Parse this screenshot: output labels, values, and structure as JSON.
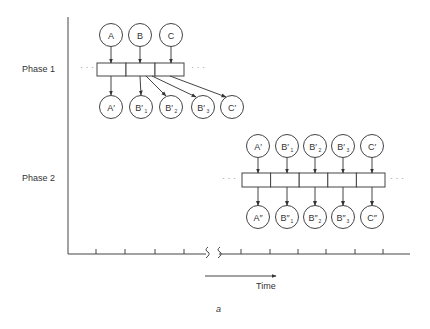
{
  "labels": {
    "phase1": "Phase 1",
    "phase2": "Phase 2",
    "time": "Time",
    "caption": "a",
    "ellipsis": "· · ·"
  },
  "colors": {
    "stroke": "#444444",
    "text": "#333333",
    "background": "#ffffff"
  },
  "axes": {
    "y_axis": {
      "x": 68,
      "y1": 17,
      "y2": 254
    },
    "x_axis": {
      "y": 254,
      "segments": [
        [
          68,
          206
        ],
        [
          219,
          410
        ]
      ]
    },
    "ticks_left": [
      96,
      125,
      155,
      184
    ],
    "ticks_right": [
      241,
      270,
      298,
      326,
      355,
      383
    ],
    "break_marks": [
      205,
      217
    ]
  },
  "phase1": {
    "inputs": [
      {
        "id": "A",
        "label": "A",
        "sub": "",
        "cx": 111,
        "cy": 35
      },
      {
        "id": "B",
        "label": "B",
        "sub": "",
        "cx": 140,
        "cy": 35
      },
      {
        "id": "C",
        "label": "C",
        "sub": "",
        "cx": 171,
        "cy": 35
      }
    ],
    "boxes": {
      "x": 97,
      "y": 63,
      "w": 29,
      "h": 13,
      "count": 3
    },
    "outputs": [
      {
        "id": "A1",
        "label": "A′",
        "sub": "",
        "cx": 111,
        "cy": 107
      },
      {
        "id": "B1",
        "label": "B′",
        "sub": "1",
        "cx": 141,
        "cy": 107
      },
      {
        "id": "B2",
        "label": "B′",
        "sub": "2",
        "cx": 171,
        "cy": 107
      },
      {
        "id": "B3",
        "label": "B′",
        "sub": "3",
        "cx": 203,
        "cy": 107
      },
      {
        "id": "C1",
        "label": "C′",
        "sub": "",
        "cx": 232,
        "cy": 107
      }
    ],
    "arrows": [
      {
        "x1": 111,
        "y1": 76,
        "x2": 111,
        "y2": 95
      },
      {
        "x1": 140,
        "y1": 76,
        "x2": 141,
        "y2": 95
      },
      {
        "x1": 146,
        "y1": 76,
        "x2": 166,
        "y2": 96
      },
      {
        "x1": 152,
        "y1": 76,
        "x2": 196,
        "y2": 97
      },
      {
        "x1": 170,
        "y1": 76,
        "x2": 226,
        "y2": 97
      }
    ]
  },
  "phase2": {
    "inputs": [
      {
        "id": "A1",
        "label": "A′",
        "sub": "",
        "cx": 258,
        "cy": 146
      },
      {
        "id": "B1",
        "label": "B′",
        "sub": "1",
        "cx": 287,
        "cy": 146
      },
      {
        "id": "B2",
        "label": "B′",
        "sub": "2",
        "cx": 315,
        "cy": 146
      },
      {
        "id": "B3",
        "label": "B′",
        "sub": "3",
        "cx": 343,
        "cy": 146
      },
      {
        "id": "C1",
        "label": "C′",
        "sub": "",
        "cx": 372,
        "cy": 146
      }
    ],
    "boxes": {
      "x": 242,
      "y": 173,
      "w": 28.6,
      "h": 14,
      "count": 5
    },
    "outputs": [
      {
        "id": "A2",
        "label": "A″",
        "sub": "",
        "cx": 258,
        "cy": 217
      },
      {
        "id": "B12",
        "label": "B″",
        "sub": "1",
        "cx": 287,
        "cy": 217
      },
      {
        "id": "B22",
        "label": "B″",
        "sub": "2",
        "cx": 315,
        "cy": 217
      },
      {
        "id": "B32",
        "label": "B″",
        "sub": "3",
        "cx": 343,
        "cy": 217
      },
      {
        "id": "C2",
        "label": "C″",
        "sub": "",
        "cx": 372,
        "cy": 217
      }
    ]
  },
  "time_arrow": {
    "x1": 205,
    "x2": 276,
    "y": 276
  }
}
